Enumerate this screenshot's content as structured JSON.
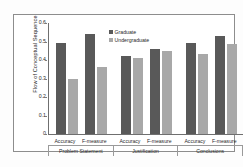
{
  "chart_data": {
    "type": "bar",
    "title": "",
    "xlabel": "",
    "ylabel": "Flow of Conceptual Sequence",
    "ylim": [
      0,
      0.6
    ],
    "ytick_labels": [
      "0.6",
      "0.5",
      "0.4",
      "0.3",
      "0.2",
      "0.1",
      "0"
    ],
    "ytick_values": [
      0.6,
      0.5,
      0.4,
      0.3,
      0.2,
      0.1,
      0
    ],
    "grid": false,
    "legend_position": "top-center",
    "categories": [
      "Accuracy",
      "F-measure",
      "Accuracy",
      "F-measure",
      "Accuracy",
      "F-measure"
    ],
    "groups": [
      {
        "name": "Problem Statement",
        "categories": [
          "Accuracy",
          "F-measure"
        ],
        "values": {
          "Graduate": [
            0.49,
            0.54
          ],
          "Undergraduate": [
            0.3,
            0.36
          ]
        }
      },
      {
        "name": "Justification",
        "categories": [
          "Accuracy",
          "F-measure"
        ],
        "values": {
          "Graduate": [
            0.42,
            0.46
          ],
          "Undergraduate": [
            0.41,
            0.45
          ]
        }
      },
      {
        "name": "Conclusions",
        "categories": [
          "Accuracy",
          "F-measure"
        ],
        "values": {
          "Graduate": [
            0.49,
            0.53
          ],
          "Undergraduate": [
            0.43,
            0.485
          ]
        }
      }
    ],
    "series": [
      {
        "name": "Graduate",
        "color": "#595959",
        "values": [
          0.49,
          0.54,
          0.42,
          0.46,
          0.49,
          0.53
        ]
      },
      {
        "name": "Undergraduate",
        "color": "#a8a8a8",
        "values": [
          0.3,
          0.36,
          0.41,
          0.45,
          0.43,
          0.485
        ]
      }
    ]
  },
  "legend": {
    "items": [
      {
        "label": "Graduate",
        "swatch": "graduate"
      },
      {
        "label": "Undergraduate",
        "swatch": "undergraduate"
      }
    ]
  },
  "caption": {
    "text": ""
  }
}
